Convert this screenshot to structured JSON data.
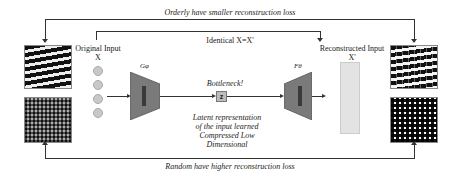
{
  "diagram": {
    "top_loop_label": "Orderly have smaller reconstruction loss",
    "bottom_loop_label": "Random have higher reconstruction loss",
    "identity_label": "Identical X=X'",
    "input": {
      "title": "Original Input",
      "symbol": "X",
      "node_count": 4
    },
    "encoder": {
      "symbol": "Gφ",
      "inner_label": "Encoder"
    },
    "bottleneck": {
      "label": "Bottleneck!",
      "node": "z",
      "description_lines": [
        "Latent representation",
        "of the input learned",
        "Compressed Low",
        "Dimensional"
      ]
    },
    "decoder": {
      "symbol": "Fθ",
      "inner_label": "Decoder"
    },
    "output": {
      "title": "Reconstructed Input",
      "symbol": "X'"
    },
    "images": {
      "original_orderly": "striped-pattern",
      "original_random": "noise-pattern",
      "reconstructed_orderly": "striped-pattern-reconstructed",
      "reconstructed_random": "noise-pattern-reconstructed"
    },
    "colors": {
      "encoder_fill": "#7a7a7a",
      "decoder_fill": "#7a7a7a",
      "node_fill": "#c8c8c8",
      "latent_fill": "#bdbdbd",
      "recon_bar_fill": "#e3e3e3",
      "line": "#333333"
    }
  }
}
